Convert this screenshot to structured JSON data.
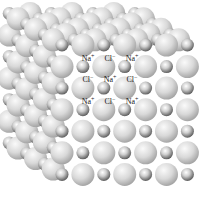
{
  "diagram": {
    "ions": {
      "sodium": {
        "symbol": "Na",
        "charge": "+",
        "label": "Na+"
      },
      "chloride": {
        "symbol": "Cl",
        "charge": "−",
        "label": "Cl−"
      }
    },
    "label_grid": [
      [
        "Na+",
        "Cl−",
        "Na+"
      ],
      [
        "Cl−",
        "Na+",
        "Cl−"
      ],
      [
        "Na+",
        "Cl−",
        "Na+"
      ]
    ],
    "colors": {
      "chloride_light": "#f4f4f4",
      "chloride_dark": "#a9a9a9",
      "sodium_light": "#ffffff",
      "sodium_dark": "#6a6a6a",
      "label": "#1a1a1a"
    }
  }
}
